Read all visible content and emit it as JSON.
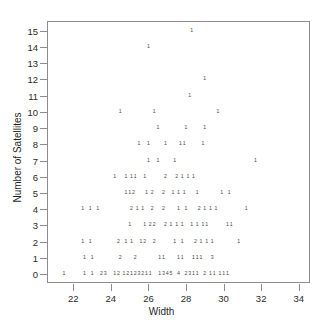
{
  "chart_data": {
    "type": "scatter",
    "title": "",
    "xlabel": "Width",
    "ylabel": "Number of Satellites",
    "xlim": [
      20.6,
      34.6
    ],
    "ylim": [
      -0.55,
      15.6
    ],
    "grid": false,
    "legend": null,
    "note": "Each plotted character is a digit giving the number of overlapping observations at that location (1 = one case, 2 = two cases, etc.)",
    "xticks": [
      22,
      24,
      26,
      28,
      30,
      32,
      34
    ],
    "yticks": [
      0,
      1,
      2,
      3,
      4,
      5,
      6,
      7,
      8,
      9,
      10,
      11,
      12,
      13,
      14,
      15
    ],
    "points": [
      {
        "x": 28.3,
        "y": 15,
        "label": "1"
      },
      {
        "x": 26.0,
        "y": 14,
        "label": "1"
      },
      {
        "x": 29.0,
        "y": 12,
        "label": "1"
      },
      {
        "x": 28.2,
        "y": 11,
        "label": "1"
      },
      {
        "x": 24.5,
        "y": 10,
        "label": "1"
      },
      {
        "x": 26.3,
        "y": 10,
        "label": "1"
      },
      {
        "x": 29.7,
        "y": 10,
        "label": "1"
      },
      {
        "x": 26.5,
        "y": 9,
        "label": "1"
      },
      {
        "x": 28.0,
        "y": 9,
        "label": "1"
      },
      {
        "x": 29.0,
        "y": 9,
        "label": "1"
      },
      {
        "x": 25.5,
        "y": 8,
        "label": "1"
      },
      {
        "x": 26.0,
        "y": 8,
        "label": "1"
      },
      {
        "x": 26.9,
        "y": 8,
        "label": "1"
      },
      {
        "x": 27.7,
        "y": 8,
        "label": "1"
      },
      {
        "x": 27.9,
        "y": 8,
        "label": "1"
      },
      {
        "x": 28.9,
        "y": 8,
        "label": "1"
      },
      {
        "x": 26.0,
        "y": 7,
        "label": "1"
      },
      {
        "x": 26.5,
        "y": 7,
        "label": "1"
      },
      {
        "x": 27.4,
        "y": 7,
        "label": "1"
      },
      {
        "x": 31.7,
        "y": 7,
        "label": "1"
      },
      {
        "x": 24.2,
        "y": 6,
        "label": "1"
      },
      {
        "x": 24.8,
        "y": 6,
        "label": "1"
      },
      {
        "x": 25.1,
        "y": 6,
        "label": "1"
      },
      {
        "x": 25.3,
        "y": 6,
        "label": "1"
      },
      {
        "x": 25.8,
        "y": 6,
        "label": "1"
      },
      {
        "x": 26.9,
        "y": 6,
        "label": "2"
      },
      {
        "x": 27.5,
        "y": 6,
        "label": "2"
      },
      {
        "x": 27.8,
        "y": 6,
        "label": "1"
      },
      {
        "x": 28.1,
        "y": 6,
        "label": "1"
      },
      {
        "x": 28.4,
        "y": 6,
        "label": "1"
      },
      {
        "x": 24.8,
        "y": 5,
        "label": "1"
      },
      {
        "x": 25.0,
        "y": 5,
        "label": "1"
      },
      {
        "x": 25.2,
        "y": 5,
        "label": "2"
      },
      {
        "x": 25.9,
        "y": 5,
        "label": "1"
      },
      {
        "x": 26.2,
        "y": 5,
        "label": "2"
      },
      {
        "x": 26.8,
        "y": 5,
        "label": "2"
      },
      {
        "x": 27.3,
        "y": 5,
        "label": "1"
      },
      {
        "x": 27.6,
        "y": 5,
        "label": "1"
      },
      {
        "x": 27.9,
        "y": 5,
        "label": "1"
      },
      {
        "x": 28.6,
        "y": 5,
        "label": "1"
      },
      {
        "x": 29.9,
        "y": 5,
        "label": "1"
      },
      {
        "x": 30.3,
        "y": 5,
        "label": "1"
      },
      {
        "x": 22.5,
        "y": 4,
        "label": "1"
      },
      {
        "x": 22.9,
        "y": 4,
        "label": "1"
      },
      {
        "x": 23.3,
        "y": 4,
        "label": "1"
      },
      {
        "x": 25.1,
        "y": 4,
        "label": "2"
      },
      {
        "x": 25.4,
        "y": 4,
        "label": "1"
      },
      {
        "x": 25.7,
        "y": 4,
        "label": "1"
      },
      {
        "x": 26.2,
        "y": 4,
        "label": "2"
      },
      {
        "x": 26.8,
        "y": 4,
        "label": "2"
      },
      {
        "x": 27.6,
        "y": 4,
        "label": "1"
      },
      {
        "x": 28.0,
        "y": 4,
        "label": "1"
      },
      {
        "x": 28.7,
        "y": 4,
        "label": "2"
      },
      {
        "x": 29.0,
        "y": 4,
        "label": "1"
      },
      {
        "x": 29.3,
        "y": 4,
        "label": "1"
      },
      {
        "x": 29.6,
        "y": 4,
        "label": "1"
      },
      {
        "x": 31.2,
        "y": 4,
        "label": "1"
      },
      {
        "x": 25.0,
        "y": 3,
        "label": "1"
      },
      {
        "x": 25.8,
        "y": 3,
        "label": "1"
      },
      {
        "x": 26.1,
        "y": 3,
        "label": "2"
      },
      {
        "x": 26.3,
        "y": 3,
        "label": "2"
      },
      {
        "x": 26.9,
        "y": 3,
        "label": "2"
      },
      {
        "x": 27.2,
        "y": 3,
        "label": "1"
      },
      {
        "x": 27.5,
        "y": 3,
        "label": "1"
      },
      {
        "x": 27.8,
        "y": 3,
        "label": "1"
      },
      {
        "x": 28.3,
        "y": 3,
        "label": "1"
      },
      {
        "x": 28.6,
        "y": 3,
        "label": "1"
      },
      {
        "x": 28.9,
        "y": 3,
        "label": "1"
      },
      {
        "x": 29.1,
        "y": 3,
        "label": "1"
      },
      {
        "x": 30.2,
        "y": 3,
        "label": "1"
      },
      {
        "x": 30.4,
        "y": 3,
        "label": "1"
      },
      {
        "x": 22.5,
        "y": 2,
        "label": "1"
      },
      {
        "x": 22.9,
        "y": 2,
        "label": "1"
      },
      {
        "x": 24.4,
        "y": 2,
        "label": "2"
      },
      {
        "x": 24.8,
        "y": 2,
        "label": "1"
      },
      {
        "x": 25.1,
        "y": 2,
        "label": "1"
      },
      {
        "x": 25.6,
        "y": 2,
        "label": "1"
      },
      {
        "x": 25.8,
        "y": 2,
        "label": "2"
      },
      {
        "x": 26.3,
        "y": 2,
        "label": "2"
      },
      {
        "x": 27.4,
        "y": 2,
        "label": "1"
      },
      {
        "x": 27.8,
        "y": 2,
        "label": "1"
      },
      {
        "x": 28.5,
        "y": 2,
        "label": "2"
      },
      {
        "x": 28.8,
        "y": 2,
        "label": "1"
      },
      {
        "x": 29.1,
        "y": 2,
        "label": "1"
      },
      {
        "x": 29.4,
        "y": 2,
        "label": "1"
      },
      {
        "x": 30.8,
        "y": 2,
        "label": "1"
      },
      {
        "x": 22.6,
        "y": 1,
        "label": "1"
      },
      {
        "x": 23.0,
        "y": 1,
        "label": "1"
      },
      {
        "x": 24.5,
        "y": 1,
        "label": "2"
      },
      {
        "x": 25.3,
        "y": 1,
        "label": "2"
      },
      {
        "x": 26.6,
        "y": 1,
        "label": "1"
      },
      {
        "x": 26.8,
        "y": 1,
        "label": "1"
      },
      {
        "x": 27.6,
        "y": 1,
        "label": "1"
      },
      {
        "x": 27.8,
        "y": 1,
        "label": "1"
      },
      {
        "x": 28.4,
        "y": 1,
        "label": "1"
      },
      {
        "x": 28.6,
        "y": 1,
        "label": "1"
      },
      {
        "x": 28.8,
        "y": 1,
        "label": "1"
      },
      {
        "x": 29.4,
        "y": 1,
        "label": "3"
      },
      {
        "x": 21.5,
        "y": 0,
        "label": "1"
      },
      {
        "x": 22.6,
        "y": 0,
        "label": "1"
      },
      {
        "x": 23.0,
        "y": 0,
        "label": "1"
      },
      {
        "x": 23.5,
        "y": 0,
        "label": "2"
      },
      {
        "x": 23.7,
        "y": 0,
        "label": "3"
      },
      {
        "x": 24.2,
        "y": 0,
        "label": "1"
      },
      {
        "x": 24.4,
        "y": 0,
        "label": "2"
      },
      {
        "x": 24.7,
        "y": 0,
        "label": "1"
      },
      {
        "x": 24.9,
        "y": 0,
        "label": "2"
      },
      {
        "x": 25.1,
        "y": 0,
        "label": "1"
      },
      {
        "x": 25.3,
        "y": 0,
        "label": "2"
      },
      {
        "x": 25.5,
        "y": 0,
        "label": "3"
      },
      {
        "x": 25.7,
        "y": 0,
        "label": "2"
      },
      {
        "x": 25.9,
        "y": 0,
        "label": "1"
      },
      {
        "x": 26.1,
        "y": 0,
        "label": "1"
      },
      {
        "x": 26.6,
        "y": 0,
        "label": "1"
      },
      {
        "x": 26.8,
        "y": 0,
        "label": "3"
      },
      {
        "x": 27.0,
        "y": 0,
        "label": "4"
      },
      {
        "x": 27.2,
        "y": 0,
        "label": "5"
      },
      {
        "x": 27.6,
        "y": 0,
        "label": "4"
      },
      {
        "x": 28.0,
        "y": 0,
        "label": "2"
      },
      {
        "x": 28.2,
        "y": 0,
        "label": "3"
      },
      {
        "x": 28.4,
        "y": 0,
        "label": "1"
      },
      {
        "x": 28.6,
        "y": 0,
        "label": "1"
      },
      {
        "x": 29.0,
        "y": 0,
        "label": "2"
      },
      {
        "x": 29.3,
        "y": 0,
        "label": "1"
      },
      {
        "x": 29.5,
        "y": 0,
        "label": "1"
      },
      {
        "x": 29.8,
        "y": 0,
        "label": "1"
      },
      {
        "x": 30.0,
        "y": 0,
        "label": "1"
      },
      {
        "x": 30.2,
        "y": 0,
        "label": "1"
      }
    ]
  }
}
